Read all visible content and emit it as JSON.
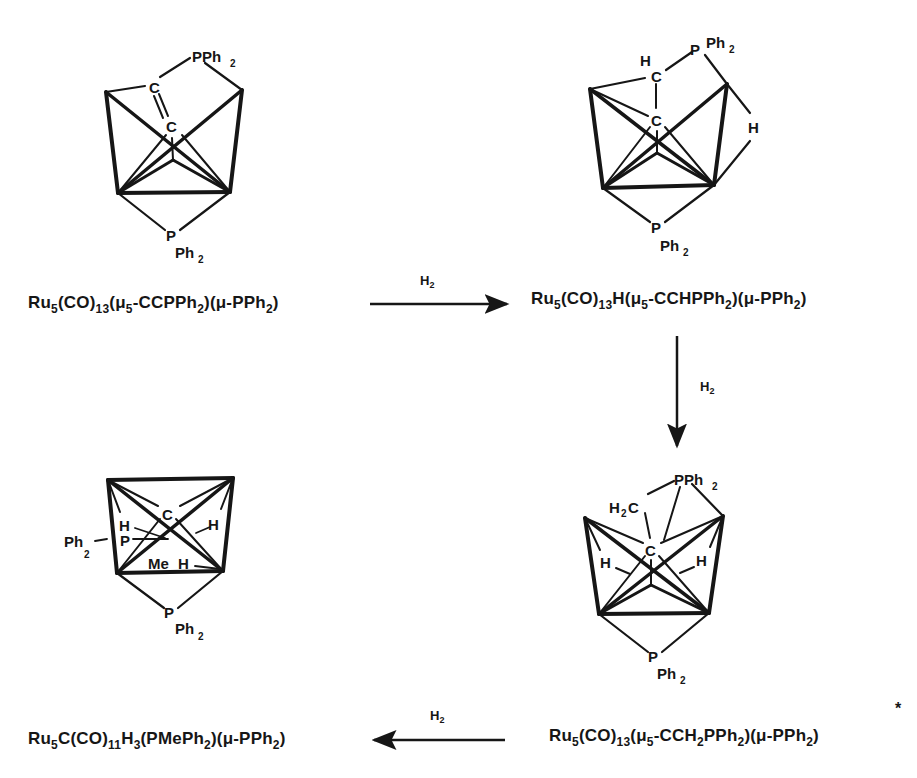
{
  "scheme": {
    "compounds": [
      {
        "id": 1,
        "formula_parts": [
          "Ru",
          "5",
          "(CO)",
          "13",
          "(μ",
          "5",
          "-CCPPh",
          "2",
          ")(μ-PPh",
          "2",
          ")"
        ],
        "formula_text": "Ru5(CO)13(μ5-CCPPh2)(μ-PPh2)",
        "atom_labels": {
          "c1": "C",
          "c2": "C",
          "p_top": "PPh",
          "p_top_sub": "2",
          "p_bottom": "P",
          "ph_bottom": "Ph",
          "ph_bottom_sub": "2"
        }
      },
      {
        "id": 2,
        "formula_text": "Ru5(CO)13H(μ5-CCHPPh2)(μ-PPh2)",
        "atom_labels": {
          "h_c": "H",
          "c1": "C",
          "c2": "C",
          "p_top": "P",
          "ph_top": "Ph",
          "ph_top_sub": "2",
          "h_bridge": "H",
          "p_bottom": "P",
          "ph_bottom": "Ph",
          "ph_bottom_sub": "2"
        }
      },
      {
        "id": 3,
        "formula_text": "Ru5(CO)13(μ5-CCH2PPh2)(μ-PPh2)",
        "footnote_mark": "*",
        "atom_labels": {
          "h2c": "H",
          "h2c_sub": "2",
          "h2c_c": "C",
          "p_top": "PPh",
          "p_top_sub": "2",
          "c": "C",
          "h_left": "H",
          "h_right": "H",
          "p_bottom": "P",
          "ph_bottom": "Ph",
          "ph_bottom_sub": "2"
        }
      },
      {
        "id": 4,
        "formula_text": "Ru5C(CO)11H3(PMePh2)(μ-PPh2)",
        "atom_labels": {
          "c": "C",
          "h_left": "H",
          "h_right": "H",
          "p_side": "P",
          "ph_side": "Ph",
          "ph_side_sub": "2",
          "me": "Me",
          "h_bottom": "H",
          "p_bottom": "P",
          "ph_bottom": "Ph",
          "ph_bottom_sub": "2"
        }
      }
    ],
    "arrows": [
      {
        "from": 1,
        "to": 2,
        "direction": "right",
        "reagent": "H",
        "reagent_sub": "2"
      },
      {
        "from": 2,
        "to": 3,
        "direction": "down",
        "reagent": "H",
        "reagent_sub": "2"
      },
      {
        "from": 3,
        "to": 4,
        "direction": "left",
        "reagent": "H",
        "reagent_sub": "2"
      }
    ]
  }
}
